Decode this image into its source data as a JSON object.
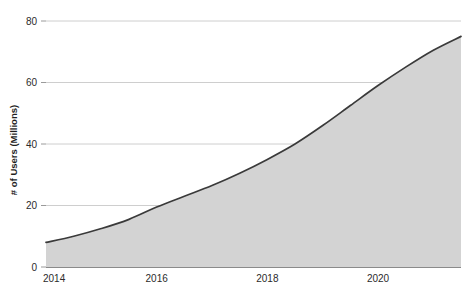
{
  "chart_data": {
    "type": "area",
    "title": "",
    "subtitle": "",
    "xlabel": "",
    "ylabel": "# of Users (Millions)",
    "xlim": [
      2014,
      2021.5
    ],
    "ylim": [
      0,
      80
    ],
    "grid": true,
    "legend": null,
    "x_ticks": [
      "2014",
      "2016",
      "2018",
      "2020"
    ],
    "x_tick_values": [
      2014,
      2016,
      2018,
      2020
    ],
    "y_ticks": [
      "0",
      "20",
      "40",
      "60",
      "80"
    ],
    "y_tick_values": [
      0,
      20,
      40,
      60,
      80
    ],
    "x": [
      2014,
      2014.5,
      2015,
      2015.5,
      2016,
      2016.5,
      2017,
      2017.5,
      2018,
      2018.5,
      2019,
      2019.5,
      2020,
      2020.5,
      2021,
      2021.5
    ],
    "series": [
      {
        "name": "# of Users (Millions)",
        "values": [
          8,
          10,
          12.5,
          15.5,
          19.5,
          23,
          26.5,
          30.5,
          35,
          40,
          46,
          52.5,
          59,
          65,
          70.5,
          75
        ],
        "fill_color": "#d3d3d3",
        "line_color": "#3a3a3a"
      }
    ],
    "annotations": []
  },
  "axes": {
    "y_axis_title": "# of Users (Millions)",
    "x_axis_title": ""
  },
  "colors": {
    "background": "#ffffff",
    "area_fill": "#d3d3d3",
    "line": "#3a3a3a",
    "gridline": "#c8c8c8",
    "baseline": "#8a8a8a",
    "tick_mark": "#9a9a9a",
    "text": "#2b2b2b"
  }
}
